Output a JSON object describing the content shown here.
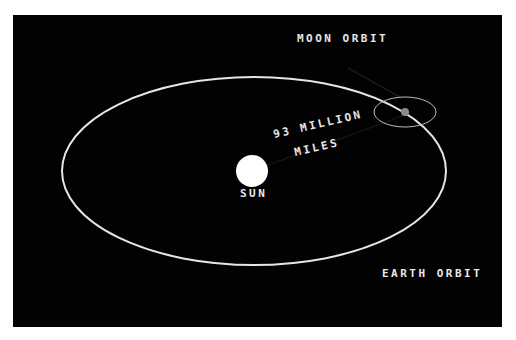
{
  "diagram": {
    "labels": {
      "moon_orbit": "MOON ORBIT",
      "distance_line1": "93 MILLION",
      "distance_line2": "MILES",
      "sun": "SUN",
      "earth_orbit": "EARTH ORBIT"
    },
    "colors": {
      "background": "#020202",
      "border": "#ffffff",
      "orbit": "#e6e6e6",
      "sun": "#ffffff",
      "earth": "#8a8a8a",
      "text": "#e8e8e8"
    }
  }
}
